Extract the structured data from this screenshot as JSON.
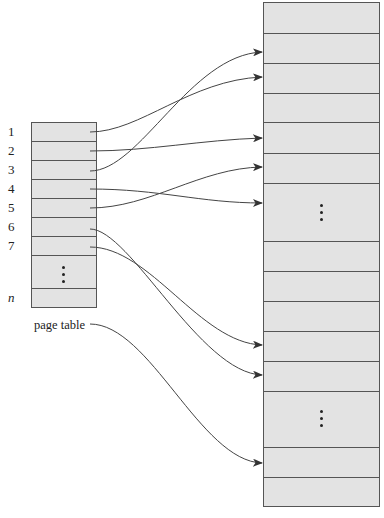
{
  "page_table": {
    "caption": "page table",
    "entries": [
      "1",
      "2",
      "3",
      "4",
      "5",
      "6",
      "7"
    ],
    "last_entry": "n",
    "ellipsis": "⋮"
  },
  "memory": {
    "frame_count_visible": 16,
    "ellipsis_blocks": 2
  },
  "mappings": [
    {
      "page": "1",
      "frame_y": 77
    },
    {
      "page": "2",
      "frame_y": 138
    },
    {
      "page": "3",
      "frame_y": 52
    },
    {
      "page": "4",
      "frame_y": 203
    },
    {
      "page": "5",
      "frame_y": 167
    },
    {
      "page": "6",
      "frame_y": 375
    },
    {
      "page": "7",
      "frame_y": 345
    },
    {
      "page": "n",
      "frame_y": 463
    }
  ],
  "colors": {
    "fill": "#e3e3e3",
    "stroke": "#555555",
    "arrow": "#444444"
  }
}
